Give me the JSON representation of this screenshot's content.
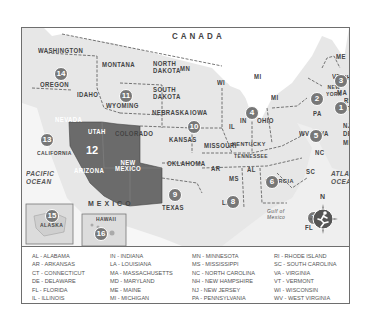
{
  "map": {
    "title_region": "CANADA",
    "country_south": "MEXICO",
    "oceans": {
      "pacific": [
        "PACIFIC",
        "OCEAN"
      ],
      "atlantic": [
        "ATLANTIC",
        "OCEAN"
      ],
      "gulf": [
        "Gulf of",
        "Mexico"
      ]
    },
    "states": {
      "washington": "WASHINGTON",
      "oregon": "OREGON",
      "california": "CALIFORNIA",
      "nevada": "NEVADA",
      "idaho": "IDAHO",
      "montana": "MONTANA",
      "wyoming": "WYOMING",
      "utah": "UTAH",
      "arizona": "ARIZONA",
      "colorado": "COLORADO",
      "new_mexico": [
        "NEW",
        "MEXICO"
      ],
      "north_dakota": [
        "NORTH",
        "DAKOTA"
      ],
      "south_dakota": [
        "SOUTH",
        "DAKOTA"
      ],
      "nebraska": "NEBRASKA",
      "kansas": "KANSAS",
      "oklahoma": "OKLAHOMA",
      "texas": "TEXAS",
      "mn": "MN",
      "iowa": "IOWA",
      "missouri": "MISSOURI",
      "ar": "AR",
      "la": "LA",
      "wi": "WI",
      "il": "IL",
      "mi_upper": "MI",
      "mi_lower": "MI",
      "in": "IN",
      "ohio": "OHIO",
      "kentucky": "KENTUCKY",
      "tennessee": "TENNESSEE",
      "ms": "MS",
      "al": "AL",
      "georgia": "GEORGIA",
      "fl": "FL",
      "sc": "SC",
      "nc": "NC",
      "va": "VA",
      "wv": "WV",
      "pa": "PA",
      "new_york": [
        "NEW",
        "YORK"
      ],
      "nj": "NJ",
      "de": "DE",
      "md": "MD",
      "ct": "CT",
      "ri": "RI",
      "ma": "MA",
      "vt": "VT",
      "nh": "NH",
      "me": "ME",
      "alaska": "ALASKA",
      "hawaii": "HAWAII"
    },
    "region_numbers": [
      "1",
      "2",
      "3",
      "4",
      "5",
      "6",
      "7",
      "8",
      "9",
      "10",
      "11",
      "12",
      "13",
      "14",
      "15",
      "16"
    ],
    "compass": {
      "north": "N"
    },
    "colors": {
      "land": "#e7e7e7",
      "highlight": "#6b6b6b",
      "water": "#f4f4f4",
      "badge": "#777777"
    }
  },
  "legend": {
    "col1": [
      "AL - ALABAMA",
      "AR - ARKANSAS",
      "CT - CONNECTICUT",
      "DE - DELAWARE",
      "FL - FLORIDA",
      "IL - ILLINOIS"
    ],
    "col2": [
      "IN - INDIANA",
      "LA - LOUISIANA",
      "MA - MASSACHUSETTS",
      "MD - MARYLAND",
      "ME - MAINE",
      "MI - MICHIGAN"
    ],
    "col3": [
      "MN - MINNESOTA",
      "MS - MISSISSIPPI",
      "NC - NORTH CAROLINA",
      "NH - NEW HAMPSHIRE",
      "NJ - NEW JERSEY",
      "PA - PENNSYLVANIA"
    ],
    "col4": [
      "RI - RHODE ISLAND",
      "SC - SOUTH CAROLINA",
      "VA - VIRGINIA",
      "VT - VERMONT",
      "WI - WISCONSIN",
      "WV - WEST VIRGINIA"
    ]
  }
}
